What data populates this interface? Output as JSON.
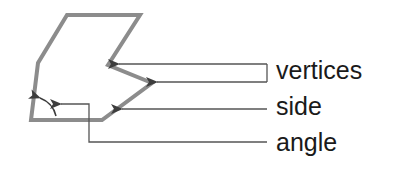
{
  "diagram": {
    "labels": {
      "vertices": "vertices",
      "side": "side",
      "angle": "angle"
    },
    "polygon": {
      "points": [
        [
          67,
          15
        ],
        [
          140,
          15
        ],
        [
          108,
          65
        ],
        [
          152,
          83
        ],
        [
          102,
          120
        ],
        [
          31,
          120
        ],
        [
          38,
          63
        ]
      ],
      "stroke_color": "#8c8c8c",
      "stroke_width": 4
    },
    "arrows": {
      "color": "#444444",
      "vertices": [
        {
          "tip": [
            117,
            64
          ],
          "tail": [
            267,
            64
          ]
        },
        {
          "tip": [
            155,
            82
          ],
          "tail": [
            267,
            82
          ]
        }
      ],
      "side": {
        "tip": [
          120,
          109
        ],
        "tail": [
          267,
          109
        ]
      },
      "angle": {
        "path": [
          [
            59,
            104
          ],
          [
            89,
            104
          ],
          [
            89,
            142
          ],
          [
            267,
            142
          ]
        ]
      },
      "angle_arc": {
        "from": [
          56,
          115
        ],
        "to": [
          38,
          96
        ]
      }
    }
  }
}
